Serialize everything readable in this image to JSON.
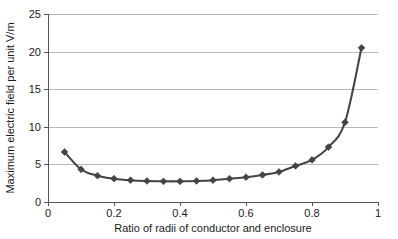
{
  "chart_data": {
    "type": "line",
    "title": "",
    "xlabel": "Ratio of radii of conductor and enclosure",
    "ylabel": "Maximum electric field per unit V/m",
    "xlim": [
      0,
      1
    ],
    "ylim": [
      0,
      25
    ],
    "grid": true,
    "grid_axis": "y",
    "legend": false,
    "marker": "diamond",
    "line_color": "#444444",
    "marker_color": "#444444",
    "grid_color": "#b0b0b0",
    "axis_color": "#555555",
    "background": "#ffffff",
    "xticks": [
      0,
      0.2,
      0.4,
      0.6,
      0.8,
      1
    ],
    "xtick_labels": [
      "0",
      "0.2",
      "0.4",
      "0.6",
      "0.8",
      "1"
    ],
    "yticks": [
      0,
      5,
      10,
      15,
      20,
      25
    ],
    "ytick_labels": [
      "0",
      "5",
      "10",
      "15",
      "20",
      "25"
    ],
    "x": [
      0.05,
      0.1,
      0.15,
      0.2,
      0.25,
      0.3,
      0.35,
      0.4,
      0.45,
      0.5,
      0.55,
      0.6,
      0.65,
      0.7,
      0.75,
      0.8,
      0.85,
      0.9,
      0.95
    ],
    "y": [
      6.65,
      4.35,
      3.5,
      3.1,
      2.9,
      2.8,
      2.75,
      2.75,
      2.8,
      2.9,
      3.1,
      3.3,
      3.6,
      4.0,
      4.8,
      5.6,
      7.3,
      10.6,
      20.5
    ],
    "series": [
      {
        "name": "Maximum electric field per unit V/m",
        "x": [
          0.05,
          0.1,
          0.15,
          0.2,
          0.25,
          0.3,
          0.35,
          0.4,
          0.45,
          0.5,
          0.55,
          0.6,
          0.65,
          0.7,
          0.75,
          0.8,
          0.85,
          0.9,
          0.95
        ],
        "values": [
          6.65,
          4.35,
          3.5,
          3.1,
          2.9,
          2.8,
          2.75,
          2.75,
          2.8,
          2.9,
          3.1,
          3.3,
          3.6,
          4.0,
          4.8,
          5.6,
          7.3,
          10.6,
          20.5
        ]
      }
    ]
  }
}
